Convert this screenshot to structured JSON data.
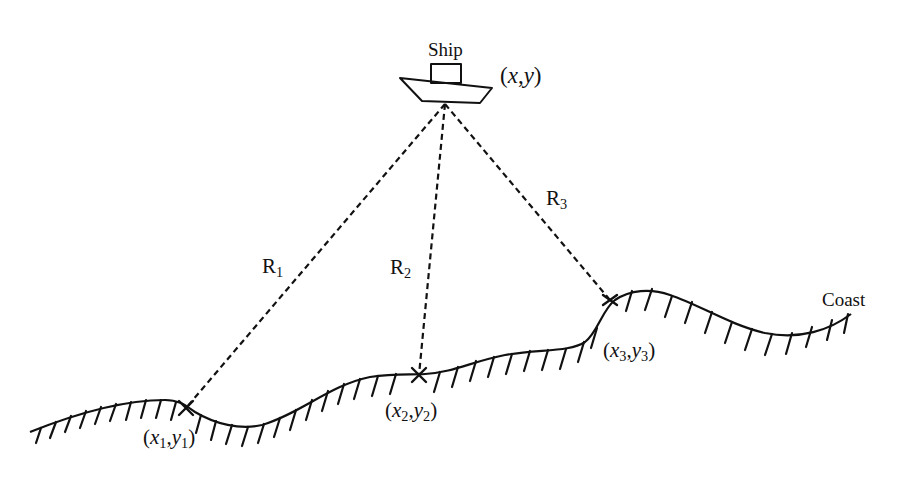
{
  "diagram": {
    "type": "ship-positioning-by-range",
    "colors": {
      "line": "#111111",
      "background": "#ffffff"
    },
    "ship": {
      "label": "Ship",
      "position_label": {
        "open": "(",
        "x": "x",
        "sep": ",",
        "y": "y",
        "close": ")"
      }
    },
    "ranges": [
      {
        "label": "R",
        "sub": "1"
      },
      {
        "label": "R",
        "sub": "2"
      },
      {
        "label": "R",
        "sub": "3"
      }
    ],
    "points": [
      {
        "open": "(",
        "x": "x",
        "xs": "1",
        "sep": ",",
        "y": "y",
        "ys": "1",
        "close": ")"
      },
      {
        "open": "(",
        "x": "x",
        "xs": "2",
        "sep": ",",
        "y": "y",
        "ys": "2",
        "close": ")"
      },
      {
        "open": "(",
        "x": "x",
        "xs": "3",
        "sep": ",",
        "y": "y",
        "ys": "3",
        "close": ")"
      }
    ],
    "coast_label": "Coast"
  }
}
